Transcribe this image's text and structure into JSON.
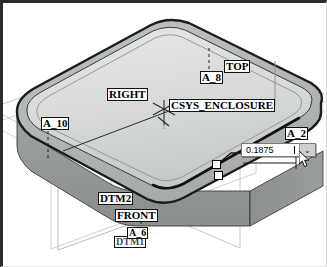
{
  "app": {
    "view_title": "3D model view",
    "model_name": "ENCLOSURE"
  },
  "labels": [
    {
      "name": "datum-axis-a8",
      "text": "A_8"
    },
    {
      "name": "datum-plane-top",
      "text": "TOP"
    },
    {
      "name": "datum-plane-right",
      "text": "RIGHT"
    },
    {
      "name": "coordinate-system",
      "text": "CSYS_ENCLOSURE"
    },
    {
      "name": "datum-axis-a10",
      "text": "A_10"
    },
    {
      "name": "datum-axis-a2",
      "text": "A_2"
    },
    {
      "name": "datum-plane-dtm2",
      "text": "DTM2"
    },
    {
      "name": "datum-plane-front",
      "text": "FRONT"
    },
    {
      "name": "datum-axis-a6",
      "text": "A_6"
    },
    {
      "name": "datum-plane-dtm1",
      "text": "DTM1"
    }
  ],
  "csys_axis_label": "Z",
  "dimension_editor": {
    "name": "dimension-value-field",
    "value": "0.1875",
    "placeholder": "0.0000",
    "dropdown_glyph": "⌄"
  },
  "colors": {
    "top_face": "#d9dbdb",
    "front_face": "#8f9292",
    "side_face": "#7f8283",
    "edge": "#1d1d1d",
    "datum_line": "#c8cacb",
    "label_text": "#000000",
    "field_bg": "#ffffff"
  }
}
